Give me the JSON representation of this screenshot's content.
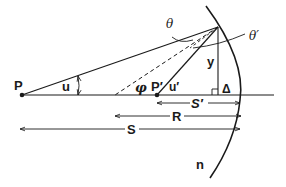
{
  "diagram": {
    "labels": {
      "object_point": "P",
      "image_point": "P′",
      "object_angle": "u",
      "image_angle": "u′",
      "incidence_angle": "θ",
      "refraction_angle": "θ′",
      "normal_angle": "φ",
      "height": "y",
      "sag": "Δ",
      "image_distance": "S′",
      "radius": "R",
      "object_distance": "S",
      "refractive_index": "n"
    },
    "colors": {
      "ink": "#1a1a1a",
      "background": "#ffffff"
    }
  }
}
